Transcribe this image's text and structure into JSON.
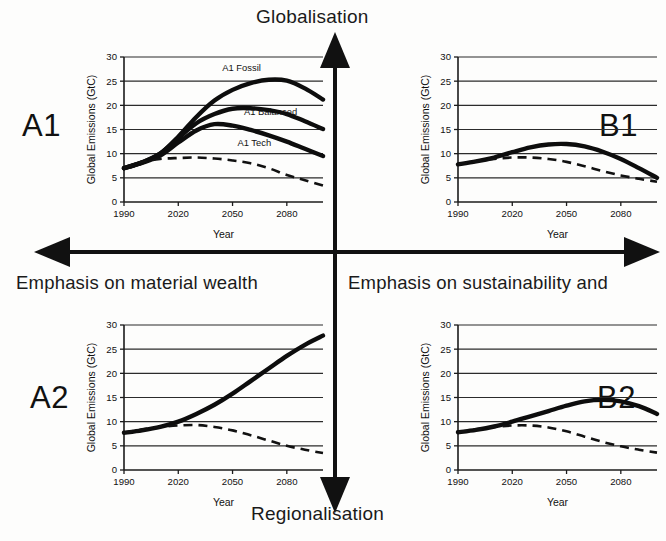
{
  "figure": {
    "poles": {
      "top": "Globalisation",
      "bottom": "Regionalisation",
      "left": "Emphasis on material wealth",
      "right": "Emphasis on sustainability and"
    },
    "quadrant_codes": {
      "top_left": "A1",
      "top_right": "B1",
      "bottom_left": "A2",
      "bottom_right": "B2"
    },
    "axes": {
      "xlabel": "Year",
      "ylabel": "Global Emissions (GtC)",
      "xticks": [
        "1990",
        "2020",
        "2050",
        "2080"
      ],
      "yticks": [
        "0",
        "5",
        "10",
        "15",
        "20",
        "25",
        "30"
      ]
    }
  },
  "chart_data": [
    {
      "id": "A1",
      "type": "line",
      "title": "A1",
      "xlabel": "Year",
      "ylabel": "Global Emissions (GtC)",
      "xlim": [
        1990,
        2100
      ],
      "ylim": [
        0,
        30
      ],
      "xticks": [
        1990,
        2020,
        2050,
        2080
      ],
      "yticks": [
        0,
        5,
        10,
        15,
        20,
        25,
        30
      ],
      "grid": true,
      "legend": "in-plot annotations",
      "x": [
        1990,
        2000,
        2010,
        2020,
        2030,
        2040,
        2050,
        2060,
        2070,
        2080,
        2090,
        2100
      ],
      "series": [
        {
          "name": "A1 Fossil",
          "style": "solid",
          "values": [
            7.0,
            8.2,
            10.0,
            13.5,
            17.6,
            21.0,
            23.2,
            24.6,
            25.3,
            25.1,
            23.5,
            21.2
          ]
        },
        {
          "name": "A1 Balanced",
          "style": "solid",
          "values": [
            7.0,
            8.2,
            10.0,
            13.2,
            16.3,
            18.2,
            19.3,
            19.4,
            19.0,
            18.2,
            16.7,
            15.1
          ]
        },
        {
          "name": "A1 Tech",
          "style": "solid",
          "values": [
            7.0,
            8.1,
            9.6,
            12.3,
            14.8,
            16.1,
            15.8,
            14.9,
            13.8,
            12.5,
            11.0,
            9.5
          ]
        },
        {
          "name": "reference dashed",
          "style": "dashed",
          "values": [
            7.0,
            8.3,
            8.9,
            9.1,
            9.2,
            9.0,
            8.6,
            8.0,
            7.0,
            5.6,
            4.5,
            3.4
          ]
        }
      ]
    },
    {
      "id": "B1",
      "type": "line",
      "title": "B1",
      "xlabel": "Year",
      "ylabel": "Global Emissions (GtC)",
      "xlim": [
        1990,
        2100
      ],
      "ylim": [
        0,
        30
      ],
      "xticks": [
        1990,
        2020,
        2050,
        2080
      ],
      "yticks": [
        0,
        5,
        10,
        15,
        20,
        25,
        30
      ],
      "grid": true,
      "x": [
        1990,
        2000,
        2010,
        2020,
        2030,
        2040,
        2050,
        2060,
        2070,
        2080,
        2090,
        2100
      ],
      "series": [
        {
          "name": "B1",
          "style": "solid",
          "values": [
            7.8,
            8.4,
            9.2,
            10.3,
            11.3,
            11.9,
            12.0,
            11.5,
            10.4,
            8.9,
            7.0,
            5.0
          ]
        },
        {
          "name": "reference dashed",
          "style": "dashed",
          "values": [
            7.8,
            8.4,
            8.9,
            9.2,
            9.2,
            8.9,
            8.3,
            7.4,
            6.4,
            5.5,
            4.8,
            4.2
          ]
        }
      ]
    },
    {
      "id": "A2",
      "type": "line",
      "title": "A2",
      "xlabel": "Year",
      "ylabel": "Global Emissions (GtC)",
      "xlim": [
        1990,
        2100
      ],
      "ylim": [
        0,
        30
      ],
      "xticks": [
        1990,
        2020,
        2050,
        2080
      ],
      "yticks": [
        0,
        5,
        10,
        15,
        20,
        25,
        30
      ],
      "grid": true,
      "x": [
        1990,
        2000,
        2010,
        2020,
        2030,
        2040,
        2050,
        2060,
        2070,
        2080,
        2090,
        2100
      ],
      "series": [
        {
          "name": "A2",
          "style": "solid",
          "values": [
            7.7,
            8.2,
            8.9,
            10.0,
            11.6,
            13.5,
            15.8,
            18.4,
            21.0,
            23.6,
            25.9,
            27.8
          ]
        },
        {
          "name": "reference dashed",
          "style": "dashed",
          "values": [
            7.7,
            8.4,
            8.9,
            9.2,
            9.3,
            8.9,
            8.2,
            7.2,
            6.1,
            5.0,
            4.2,
            3.5
          ]
        }
      ]
    },
    {
      "id": "B2",
      "type": "line",
      "title": "B2",
      "xlabel": "Year",
      "ylabel": "Global Emissions (GtC)",
      "xlim": [
        1990,
        2100
      ],
      "ylim": [
        0,
        30
      ],
      "xticks": [
        1990,
        2020,
        2050,
        2080
      ],
      "yticks": [
        0,
        5,
        10,
        15,
        20,
        25,
        30
      ],
      "grid": true,
      "x": [
        1990,
        2000,
        2010,
        2020,
        2030,
        2040,
        2050,
        2060,
        2070,
        2080,
        2090,
        2100
      ],
      "series": [
        {
          "name": "B2",
          "style": "solid",
          "values": [
            7.8,
            8.3,
            9.0,
            10.0,
            11.1,
            12.2,
            13.3,
            14.2,
            14.5,
            14.2,
            13.2,
            11.6
          ]
        },
        {
          "name": "reference dashed",
          "style": "dashed",
          "values": [
            7.8,
            8.4,
            8.9,
            9.2,
            9.2,
            8.8,
            8.0,
            6.9,
            5.8,
            4.9,
            4.2,
            3.6
          ]
        }
      ]
    }
  ],
  "series_labels": {
    "a1_fossil": "A1 Fossil",
    "a1_balanced": "A1 Balanced",
    "a1_tech": "A1 Tech"
  }
}
